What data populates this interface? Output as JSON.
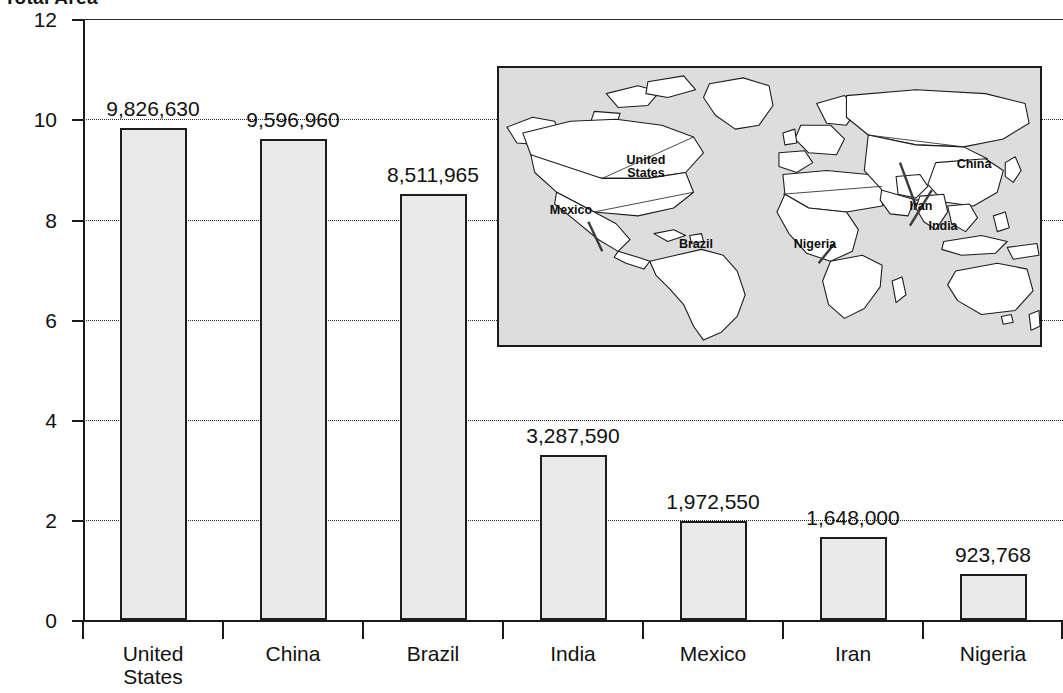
{
  "chart_data": {
    "type": "bar",
    "title": "Total Area",
    "xlabel": "",
    "ylabel": "Square Kilometers (in millions)",
    "categories": [
      "United States",
      "China",
      "Brazil",
      "India",
      "Mexico",
      "Iran",
      "Nigeria"
    ],
    "values": [
      9826630,
      9596960,
      8511965,
      3287590,
      1972550,
      1648000,
      923768
    ],
    "value_labels": [
      "9,826,630",
      "9,596,960",
      "8,511,965",
      "3,287,590",
      "1,972,550",
      "1,648,000",
      "923,768"
    ],
    "values_in_millions": [
      9.82663,
      9.59696,
      8.511965,
      3.28759,
      1.97255,
      1.648,
      0.923768
    ],
    "ylim": [
      0,
      12
    ],
    "yticks": [
      0,
      2,
      4,
      6,
      8,
      10,
      12
    ],
    "ytick_labels": [
      "0",
      "2",
      "4",
      "6",
      "8",
      "10",
      "12"
    ],
    "grid": true,
    "grid_style": "dotted",
    "legend": "none",
    "bar_fill": "#e9e9e9",
    "bar_stroke": "#1d1d1d"
  },
  "inset_map": {
    "name": "world-map-inset",
    "background": "#dddddd",
    "border": "#1b1b1b",
    "labels": [
      {
        "text": "United\nStates",
        "line1": "United",
        "line2": "States"
      },
      {
        "text": "Mexico",
        "line1": "Mexico",
        "line2": ""
      },
      {
        "text": "Brazil",
        "line1": "Brazil",
        "line2": ""
      },
      {
        "text": "Nigeria",
        "line1": "Nigeria",
        "line2": ""
      },
      {
        "text": "Iran",
        "line1": "Iran",
        "line2": ""
      },
      {
        "text": "India",
        "line1": "India",
        "line2": ""
      },
      {
        "text": "China",
        "line1": "China",
        "line2": ""
      }
    ]
  }
}
